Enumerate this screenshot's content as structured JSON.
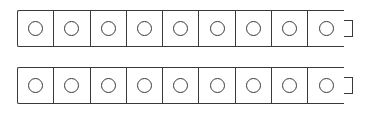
{
  "strips": [
    {
      "id": "strip-1",
      "cells": 9,
      "top": 10,
      "connector": "right-tab"
    },
    {
      "id": "strip-2",
      "cells": 9,
      "top": 67,
      "connector": "right-tab"
    }
  ],
  "colors": {
    "stroke": "#3a3a3a",
    "fill": "#ffffff",
    "background": "#ffffff"
  },
  "icons": {
    "cell_marker": "circle-icon",
    "connector": "tab-connector"
  }
}
